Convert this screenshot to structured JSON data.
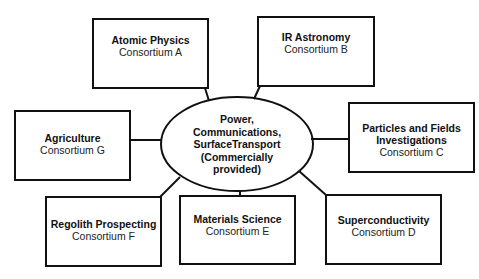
{
  "diagram": {
    "hub": {
      "lines": [
        "Power,",
        "Communications,",
        "SurfaceTransport",
        "(Commercially",
        "provided)"
      ]
    },
    "nodes": [
      {
        "title": "Atomic Physics",
        "subtitle": "Consortium A"
      },
      {
        "title": "IR Astronomy",
        "subtitle": "Consortium B"
      },
      {
        "title": "Particles and Fields Investigations",
        "subtitle": "Consortium C"
      },
      {
        "title": "Superconductivity",
        "subtitle": "Consortium D"
      },
      {
        "title": "Materials Science",
        "subtitle": "Consortium E"
      },
      {
        "title": "Regolith Prospecting",
        "subtitle": "Consortium F"
      },
      {
        "title": "Agriculture",
        "subtitle": "Consortium G"
      }
    ],
    "colors": {
      "stroke": "#111111",
      "background": "#ffffff"
    }
  }
}
